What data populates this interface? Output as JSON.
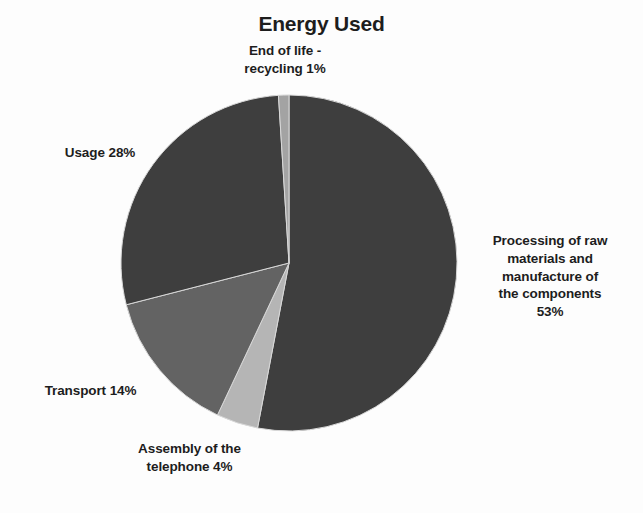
{
  "chart_data": {
    "type": "pie",
    "title": "Energy Used",
    "xlabel": "",
    "ylabel": "",
    "legend_position": "none",
    "grid": false,
    "categories": [
      "Processing of raw materials and manufacture of the components",
      "Assembly of the telephone",
      "Transport",
      "Usage",
      "End of life - recycling"
    ],
    "values": [
      53,
      4,
      14,
      28,
      1
    ],
    "unit": "%",
    "slices": [
      {
        "name": "processing",
        "label_lines": [
          "Processing of raw",
          "materials and",
          "manufacture of",
          "the components",
          "53%"
        ],
        "label_text": "Processing of raw materials and manufacture of the components 53%",
        "value": 53,
        "color": "#3e3e3e"
      },
      {
        "name": "assembly",
        "label_lines": [
          "Assembly of the",
          "telephone 4%"
        ],
        "label_text": "Assembly of the telephone 4%",
        "value": 4,
        "color": "#b5b5b5"
      },
      {
        "name": "transport",
        "label_lines": [
          "Transport 14%"
        ],
        "label_text": "Transport 14%",
        "value": 14,
        "color": "#636363"
      },
      {
        "name": "usage",
        "label_lines": [
          "Usage 28%"
        ],
        "label_text": "Usage 28%",
        "value": 28,
        "color": "#3e3e3e"
      },
      {
        "name": "end-of-life",
        "label_lines": [
          "End of life -",
          "recycling 1%"
        ],
        "label_text": "End of life - recycling 1%",
        "value": 1,
        "color": "#a3a3a3"
      }
    ],
    "geometry": {
      "center_x": 289,
      "center_y": 263,
      "radius": 168,
      "start_angle_deg": -90
    },
    "background_color": "#fdfdfd",
    "text_color": "#1d1d1d"
  },
  "labels": {
    "title": "Energy Used",
    "end_of_life_line1": "End of life -",
    "end_of_life_line2": "recycling 1%",
    "usage": "Usage 28%",
    "transport": "Transport 14%",
    "assembly_line1": "Assembly of the",
    "assembly_line2": "telephone 4%",
    "processing_line1": "Processing of raw",
    "processing_line2": "materials and",
    "processing_line3": "manufacture of",
    "processing_line4": "the components",
    "processing_line5": "53%"
  }
}
